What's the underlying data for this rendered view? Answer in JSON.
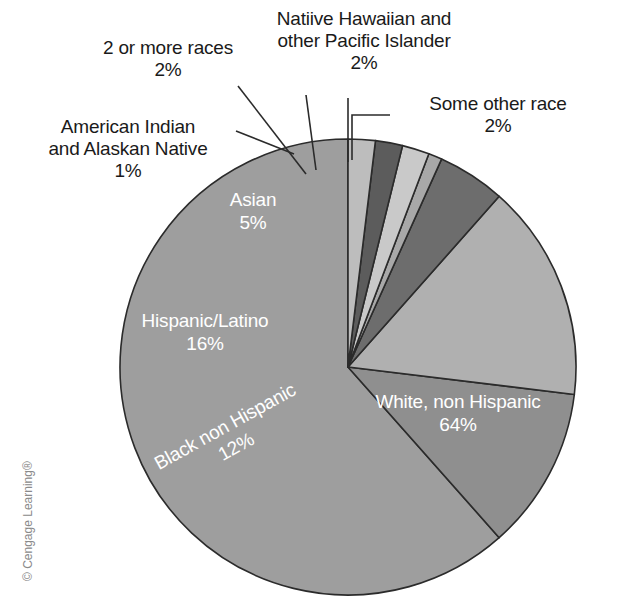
{
  "figure": {
    "background_color": "#ffffff",
    "credit": "© Cengage Learning®"
  },
  "chart_data": {
    "type": "pie",
    "title": "",
    "subtitle": "",
    "xlabel": "",
    "ylabel": "",
    "grid": false,
    "legend_position": "none",
    "label_style": "callouts-and-inslice",
    "center": {
      "x": 348,
      "y": 367
    },
    "radius": 228,
    "start_angle_deg": -90,
    "direction": "counterclockwise",
    "total_percent": 104,
    "categories": [
      "White, non Hispanic",
      "Black non Hispanic",
      "Hispanic/Latino",
      "Asian",
      "American Indian and Alaskan Native",
      "2 or more races",
      "Natiive Hawaiian and other Pacific Islander",
      "Some other race"
    ],
    "values": [
      64,
      12,
      16,
      5,
      1,
      2,
      2,
      2
    ],
    "slices": [
      {
        "name": "White, non Hispanic",
        "label": "White, non Hispanic",
        "value_label": "64%",
        "value": 64,
        "color": "#9e9e9e",
        "label_placement": "inside",
        "label_x": 458,
        "label_y": 408,
        "label_rotation": 0
      },
      {
        "name": "Black non Hispanic",
        "label": "Black non Hispanic",
        "value_label": "12%",
        "value": 12,
        "color": "#8f8f8f",
        "label_placement": "inside",
        "label_x": 228,
        "label_y": 432,
        "label_rotation": -29
      },
      {
        "name": "Hispanic/Latino",
        "label": "Hispanic/Latino",
        "value_label": "16%",
        "value": 16,
        "color": "#b0b0b0",
        "label_placement": "inside",
        "label_x": 205,
        "label_y": 327,
        "label_rotation": 0
      },
      {
        "name": "Asian",
        "label": "Asian",
        "value_label": "5%",
        "value": 5,
        "color": "#6d6d6d",
        "label_placement": "inside",
        "label_x": 253,
        "label_y": 206,
        "label_rotation": 0
      },
      {
        "name": "American Indian and Alaskan Native",
        "label": "American Indian\nand Alaskan Native",
        "value_label": "1%",
        "value": 1,
        "color": "#a8a8a8",
        "label_placement": "callout",
        "callout_x": 22,
        "callout_y": 116,
        "callout_width": 212
      },
      {
        "name": "2 or more races",
        "label": "2 or more races",
        "value_label": "2%",
        "value": 2,
        "color": "#c9c9c9",
        "label_placement": "callout",
        "callout_x": 72,
        "callout_y": 37,
        "callout_width": 192
      },
      {
        "name": "Natiive Hawaiian and other Pacific Islander",
        "label": "Natiive Hawaiian and\nother Pacific Islander",
        "value_label": "2%",
        "value": 2,
        "color": "#5c5c5c",
        "label_placement": "callout",
        "callout_x": 248,
        "callout_y": 8,
        "callout_width": 232
      },
      {
        "name": "Some other race",
        "label": "Some other race",
        "value_label": "2%",
        "value": 2,
        "color": "#bdbdbd",
        "label_placement": "callout",
        "callout_x": 392,
        "callout_y": 93,
        "callout_width": 212
      }
    ],
    "slice_outline_color": "#2b2b2b",
    "leader_line_color": "#2b2b2b"
  }
}
